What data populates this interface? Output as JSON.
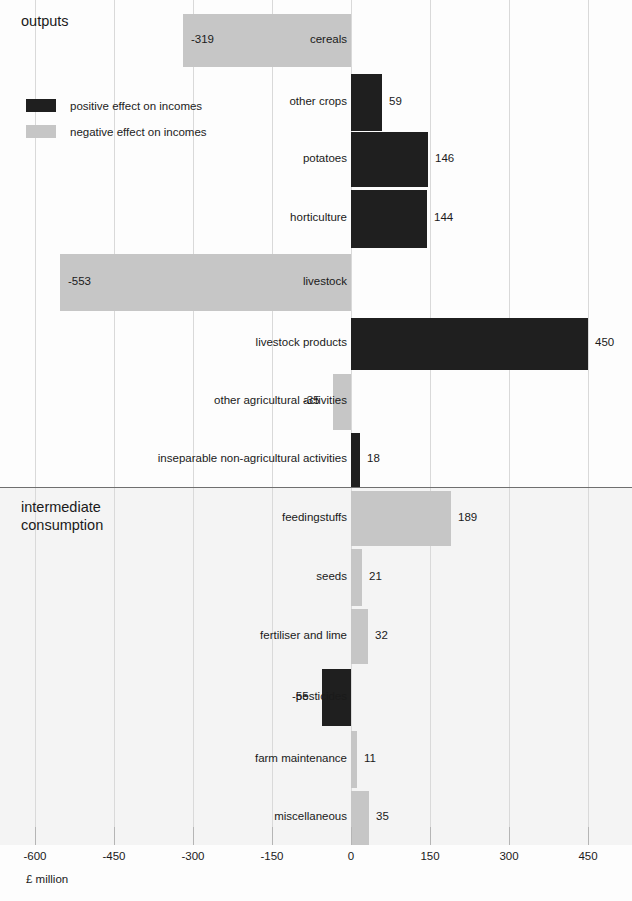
{
  "chart_data": {
    "type": "bar",
    "orientation": "horizontal",
    "title": "",
    "xlabel": "£ million",
    "ylabel": "",
    "xlim": [
      -600,
      450
    ],
    "grid": true,
    "legend_position": "top-left",
    "xticks": [
      "-600",
      "-450",
      "-300",
      "-150",
      "0",
      "150",
      "300",
      "450"
    ],
    "xtick_values": [
      -600,
      -450,
      -300,
      -150,
      0,
      150,
      300,
      450
    ],
    "legend": [
      {
        "label": "positive effect on incomes",
        "color": "#1f1f1f"
      },
      {
        "label": "negative effect on incomes",
        "color": "#c6c6c6"
      }
    ],
    "sections": [
      {
        "name": "outputs",
        "label": "outputs"
      },
      {
        "name": "intermediate-consumption",
        "label": "intermediate\nconsumption"
      }
    ],
    "categories": [
      "cereals",
      "other crops",
      "potatoes",
      "horticulture",
      "livestock",
      "livestock products",
      "other agricultural activities",
      "inseparable non-agricultural activities",
      "feedingstuffs",
      "seeds",
      "fertiliser and lime",
      "pesticides",
      "farm maintenance",
      "miscellaneous"
    ],
    "values": [
      -319,
      59,
      146,
      144,
      -553,
      450,
      -35,
      18,
      189,
      21,
      32,
      -55,
      11,
      35
    ],
    "value_labels": [
      "-319",
      "59",
      "146",
      "144",
      "-553",
      "450",
      "-35",
      "18",
      "189",
      "21",
      "32",
      "-55",
      "11",
      "35"
    ],
    "bars": [
      {
        "category": "cereals",
        "value": -319,
        "label": "-319",
        "effect": "negative",
        "section": "outputs"
      },
      {
        "category": "other crops",
        "value": 59,
        "label": "59",
        "effect": "positive",
        "section": "outputs"
      },
      {
        "category": "potatoes",
        "value": 146,
        "label": "146",
        "effect": "positive",
        "section": "outputs"
      },
      {
        "category": "horticulture",
        "value": 144,
        "label": "144",
        "effect": "positive",
        "section": "outputs"
      },
      {
        "category": "livestock",
        "value": -553,
        "label": "-553",
        "effect": "negative",
        "section": "outputs"
      },
      {
        "category": "livestock products",
        "value": 450,
        "label": "450",
        "effect": "positive",
        "section": "outputs"
      },
      {
        "category": "other agricultural activities",
        "value": -35,
        "label": "-35",
        "effect": "negative",
        "section": "outputs"
      },
      {
        "category": "inseparable non-agricultural activities",
        "value": 18,
        "label": "18",
        "effect": "positive",
        "section": "outputs"
      },
      {
        "category": "feedingstuffs",
        "value": 189,
        "label": "189",
        "effect": "negative",
        "section": "intermediate-consumption"
      },
      {
        "category": "seeds",
        "value": 21,
        "label": "21",
        "effect": "negative",
        "section": "intermediate-consumption"
      },
      {
        "category": "fertiliser and lime",
        "value": 32,
        "label": "32",
        "effect": "negative",
        "section": "intermediate-consumption"
      },
      {
        "category": "pesticides",
        "value": -55,
        "label": "-55",
        "effect": "positive",
        "section": "intermediate-consumption"
      },
      {
        "category": "farm maintenance",
        "value": 11,
        "label": "11",
        "effect": "negative",
        "section": "intermediate-consumption"
      },
      {
        "category": "miscellaneous",
        "value": 35,
        "label": "35",
        "effect": "negative",
        "section": "intermediate-consumption"
      }
    ],
    "colors": {
      "positive": "#1f1f1f",
      "negative": "#c6c6c6",
      "gridline": "#d9d9d9",
      "divider": "#6f6f6f",
      "text": "#1a1a1a",
      "background_upper": "#fdfdfd",
      "background_lower": "#f4f4f4"
    }
  },
  "layout": {
    "zero_x": 351,
    "px_per_unit": 0.5267,
    "plot_top": 8,
    "plot_bottom": 845,
    "divider_y": 487,
    "bar_rows": [
      {
        "top": 14,
        "height": 53
      },
      {
        "top": 74,
        "height": 57
      },
      {
        "top": 132,
        "height": 55
      },
      {
        "top": 190,
        "height": 58
      },
      {
        "top": 254,
        "height": 57
      },
      {
        "top": 318,
        "height": 52
      },
      {
        "top": 374,
        "height": 56
      },
      {
        "top": 433,
        "height": 54
      },
      {
        "top": 491,
        "height": 55
      },
      {
        "top": 549,
        "height": 57
      },
      {
        "top": 609,
        "height": 55
      },
      {
        "top": 669,
        "height": 57
      },
      {
        "top": 731,
        "height": 57
      },
      {
        "top": 791,
        "height": 54
      }
    ],
    "section_headings": [
      {
        "left": 21,
        "top": 12
      },
      {
        "left": 21,
        "top": 498
      }
    ]
  }
}
